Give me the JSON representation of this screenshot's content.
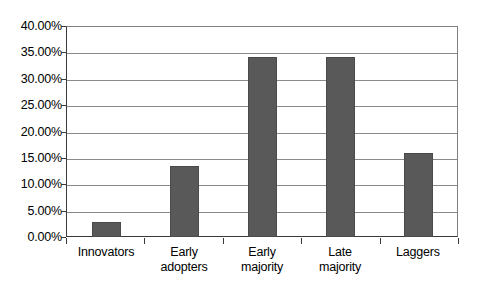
{
  "chart_data": {
    "type": "bar",
    "title": "",
    "subtitle": "",
    "xlabel": "",
    "ylabel": "",
    "categories": [
      "Innovators",
      "Early adopters",
      "Early majority",
      "Late majority",
      "Laggers"
    ],
    "category_lines": [
      [
        "Innovators"
      ],
      [
        "Early",
        "adopters"
      ],
      [
        "Early",
        "majority"
      ],
      [
        "Late",
        "majority"
      ],
      [
        "Laggers"
      ]
    ],
    "values": [
      2.8,
      13.6,
      34.2,
      34.2,
      16.0
    ],
    "value_labels": [
      "2.80%",
      "13.60%",
      "34.20%",
      "34.20%",
      "16.00%"
    ],
    "ylim": [
      0,
      40
    ],
    "ytick_values": [
      40,
      35,
      30,
      25,
      20,
      15,
      10,
      5,
      0
    ],
    "ytick_labels": [
      "40.00%",
      "35.00%",
      "30.00%",
      "25.00%",
      "20.00%",
      "15.00%",
      "10.00%",
      "5.00%",
      "0.00%"
    ],
    "grid": true,
    "grid_axis": "y",
    "legend": false,
    "legend_position": "none",
    "bar_color": "#595959",
    "grid_color": "#8a8a8a",
    "axis_color": "#3a3a3a",
    "background_color": "#ffffff"
  }
}
